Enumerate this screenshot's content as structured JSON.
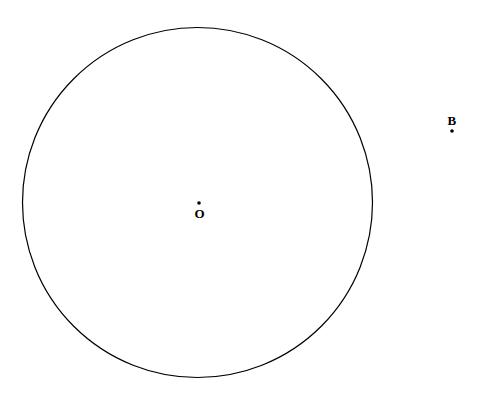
{
  "figure": {
    "background_color": "#ffffff",
    "stroke_color": "#000000",
    "width": 483,
    "height": 395,
    "circle": {
      "name": "main-circle",
      "center_x": 197.5,
      "center_y": 202.5,
      "radius": 175,
      "stroke_width": 1.2,
      "fill": "none"
    },
    "points": [
      {
        "id": "O",
        "label": "O",
        "x": 199,
        "y": 203,
        "dot_radius": 1.8,
        "label_position": "below",
        "description": "centre of circle"
      },
      {
        "id": "B",
        "label": "B",
        "x": 452,
        "y": 131,
        "dot_radius": 1.8,
        "label_position": "above",
        "description": "point outside circle"
      }
    ]
  }
}
